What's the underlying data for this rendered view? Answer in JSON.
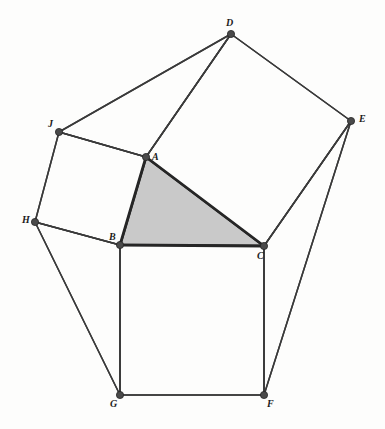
{
  "figure": {
    "canvas": {
      "width": 385,
      "height": 429
    },
    "colors": {
      "background": "#fdfdfc",
      "stroke": "#3a3a3a",
      "stroke_bold": "#262626",
      "triangle_fill": "#c9c9c9",
      "square_fill": "#fdfdfc",
      "vertex_fill": "#4a4a4a",
      "label_color": "#1b1b1b"
    },
    "vertices": [
      {
        "name": "A",
        "label": "A",
        "x": 146,
        "y": 157,
        "label_x": 152,
        "label_y": 152,
        "r": 3.6
      },
      {
        "name": "B",
        "label": "B",
        "x": 120,
        "y": 245,
        "label_x": 109,
        "label_y": 232,
        "r": 3.6
      },
      {
        "name": "C",
        "label": "C",
        "x": 264,
        "y": 246,
        "label_x": 257,
        "label_y": 251,
        "r": 3.6
      },
      {
        "name": "D",
        "label": "D",
        "x": 231,
        "y": 34,
        "label_x": 226,
        "label_y": 18,
        "r": 3.6
      },
      {
        "name": "E",
        "label": "E",
        "x": 351,
        "y": 121,
        "label_x": 359,
        "label_y": 114,
        "r": 3.6
      },
      {
        "name": "F",
        "label": "F",
        "x": 264,
        "y": 395,
        "label_x": 267,
        "label_y": 399,
        "r": 3.6
      },
      {
        "name": "G",
        "label": "G",
        "x": 120,
        "y": 395,
        "label_x": 110,
        "label_y": 399,
        "r": 3.6
      },
      {
        "name": "H",
        "label": "H",
        "x": 35,
        "y": 222,
        "label_x": 22,
        "label_y": 215,
        "r": 3.6
      },
      {
        "name": "J",
        "label": "J",
        "x": 59,
        "y": 132,
        "label_x": 48,
        "label_y": 119,
        "r": 3.6
      }
    ],
    "faces": [
      {
        "name": "triangle-abc",
        "points": "146,157 120,245 264,246",
        "fill": "#c9c9c9",
        "stroke": "#262626",
        "stroke_width": 2.6
      },
      {
        "name": "square-on-ac-acde",
        "points": "146,157 264,246 351,121 231,34",
        "fill": "#fdfdfc",
        "stroke": "#3a3a3a",
        "stroke_width": 1.5
      },
      {
        "name": "square-on-ab-abhj",
        "points": "146,157 120,245 35,222 59,132",
        "fill": "#fdfdfc",
        "stroke": "#3a3a3a",
        "stroke_width": 1.5
      },
      {
        "name": "square-on-bc-bcfg",
        "points": "120,245 264,246 264,395 120,395",
        "fill": "#fdfdfc",
        "stroke": "#3a3a3a",
        "stroke_width": 1.5
      },
      {
        "name": "triangle-jad",
        "points": "59,132 146,157 231,34",
        "fill": "none",
        "stroke": "#3a3a3a",
        "stroke_width": 1.5
      },
      {
        "name": "triangle-hbg",
        "points": "35,222 120,245 120,395",
        "fill": "none",
        "stroke": "#3a3a3a",
        "stroke_width": 1.5
      },
      {
        "name": "triangle-ecf",
        "points": "351,121 264,246 264,395",
        "fill": "none",
        "stroke": "#3a3a3a",
        "stroke_width": 1.5
      }
    ],
    "edges": [
      {
        "name": "edge-ab",
        "from": "A",
        "to": "B",
        "x1": 146,
        "y1": 157,
        "x2": 120,
        "y2": 245,
        "bold": true
      },
      {
        "name": "edge-ac",
        "from": "A",
        "to": "C",
        "x1": 146,
        "y1": 157,
        "x2": 264,
        "y2": 246,
        "bold": true
      },
      {
        "name": "edge-bc",
        "from": "B",
        "to": "C",
        "x1": 120,
        "y1": 245,
        "x2": 264,
        "y2": 246,
        "bold": true
      },
      {
        "name": "edge-ad",
        "from": "A",
        "to": "D",
        "x1": 146,
        "y1": 157,
        "x2": 231,
        "y2": 34,
        "bold": false
      },
      {
        "name": "edge-de",
        "from": "D",
        "to": "E",
        "x1": 231,
        "y1": 34,
        "x2": 351,
        "y2": 121,
        "bold": false
      },
      {
        "name": "edge-ec",
        "from": "E",
        "to": "C",
        "x1": 351,
        "y1": 121,
        "x2": 264,
        "y2": 246,
        "bold": false
      },
      {
        "name": "edge-dj",
        "from": "D",
        "to": "J",
        "x1": 231,
        "y1": 34,
        "x2": 59,
        "y2": 132,
        "bold": false
      },
      {
        "name": "edge-ja",
        "from": "J",
        "to": "A",
        "x1": 59,
        "y1": 132,
        "x2": 146,
        "y2": 157,
        "bold": false
      },
      {
        "name": "edge-jh",
        "from": "J",
        "to": "H",
        "x1": 59,
        "y1": 132,
        "x2": 35,
        "y2": 222,
        "bold": false
      },
      {
        "name": "edge-hb",
        "from": "H",
        "to": "B",
        "x1": 35,
        "y1": 222,
        "x2": 120,
        "y2": 245,
        "bold": false
      },
      {
        "name": "edge-hg",
        "from": "H",
        "to": "G",
        "x1": 35,
        "y1": 222,
        "x2": 120,
        "y2": 395,
        "bold": false
      },
      {
        "name": "edge-bg",
        "from": "B",
        "to": "G",
        "x1": 120,
        "y1": 245,
        "x2": 120,
        "y2": 395,
        "bold": false
      },
      {
        "name": "edge-gf",
        "from": "G",
        "to": "F",
        "x1": 120,
        "y1": 395,
        "x2": 264,
        "y2": 395,
        "bold": false
      },
      {
        "name": "edge-cf",
        "from": "C",
        "to": "F",
        "x1": 264,
        "y1": 246,
        "x2": 264,
        "y2": 395,
        "bold": false
      },
      {
        "name": "edge-ef",
        "from": "E",
        "to": "F",
        "x1": 351,
        "y1": 121,
        "x2": 264,
        "y2": 395,
        "bold": false
      }
    ]
  }
}
